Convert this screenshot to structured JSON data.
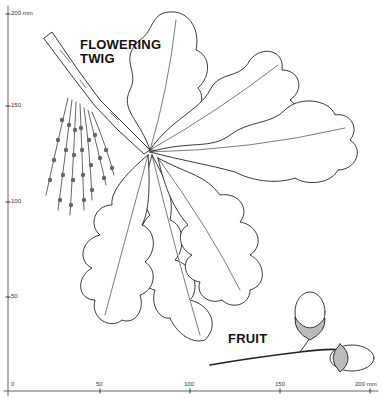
{
  "labels": {
    "flowering_twig": [
      "FLOWERING",
      "TWIG"
    ],
    "fruit": "FRUIT"
  },
  "scale": {
    "y_axis": {
      "ticks": [
        "200 mm",
        "150",
        "100",
        "50"
      ]
    },
    "x_axis": {
      "ticks": [
        "0",
        "50",
        "100",
        "150",
        "200 mm"
      ]
    }
  },
  "colors": {
    "ink": "#222222",
    "background": "#ffffff"
  }
}
